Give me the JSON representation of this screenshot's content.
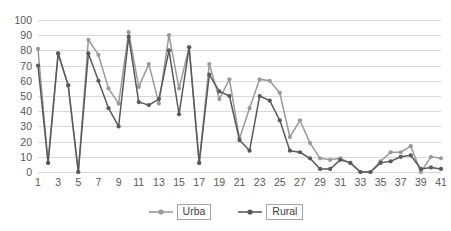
{
  "chart_data": {
    "type": "line",
    "title": "",
    "xlabel": "",
    "ylabel": "",
    "ylim": [
      0,
      100
    ],
    "ytick_step": 10,
    "yticks": [
      100,
      90,
      80,
      70,
      60,
      50,
      40,
      30,
      20,
      10,
      0
    ],
    "grid": true,
    "legend_position": "bottom",
    "x": [
      1,
      2,
      3,
      4,
      5,
      6,
      7,
      8,
      9,
      10,
      11,
      12,
      13,
      14,
      15,
      16,
      17,
      18,
      19,
      20,
      21,
      22,
      23,
      24,
      25,
      26,
      27,
      28,
      29,
      30,
      31,
      32,
      33,
      34,
      35,
      36,
      37,
      38,
      39,
      40,
      41
    ],
    "xtick_labels": [
      "1",
      "3",
      "5",
      "7",
      "9",
      "11",
      "13",
      "15",
      "17",
      "19",
      "21",
      "23",
      "25",
      "27",
      "29",
      "31",
      "33",
      "35",
      "37",
      "39",
      "41"
    ],
    "xtick_values": [
      1,
      3,
      5,
      7,
      9,
      11,
      13,
      15,
      17,
      19,
      21,
      23,
      25,
      27,
      29,
      31,
      33,
      35,
      37,
      39,
      41
    ],
    "series": [
      {
        "name": "Urba",
        "color": "#9a9a9a",
        "marker": "circle",
        "values": [
          81,
          6,
          78,
          57,
          0,
          87,
          77,
          55,
          45,
          92,
          56,
          71,
          45,
          90,
          55,
          82,
          6,
          71,
          48,
          61,
          22,
          42,
          61,
          60,
          52,
          23,
          34,
          19,
          9,
          8,
          9,
          6,
          0,
          0,
          7,
          13,
          13,
          17,
          0,
          10,
          9
        ]
      },
      {
        "name": "Rural",
        "color": "#595959",
        "marker": "circle",
        "values": [
          70,
          6,
          78,
          57,
          0,
          78,
          60,
          42,
          30,
          89,
          46,
          44,
          48,
          80,
          38,
          82,
          6,
          64,
          53,
          50,
          21,
          14,
          50,
          47,
          34,
          14,
          13,
          9,
          2,
          2,
          8,
          6,
          0,
          0,
          6,
          7,
          10,
          11,
          2,
          3,
          2
        ]
      }
    ]
  },
  "legend": {
    "items": [
      {
        "label": "Urba",
        "color": "#9a9a9a"
      },
      {
        "label": "Rural",
        "color": "#595959"
      }
    ]
  }
}
